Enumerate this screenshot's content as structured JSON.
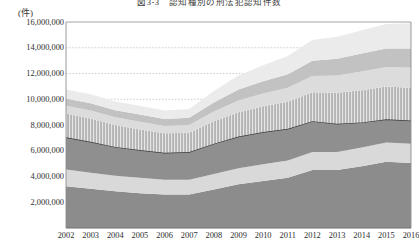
{
  "chart_data": {
    "type": "area",
    "stacked": true,
    "title": "図3-3　認知種別の刑法犯認知件数",
    "unit_label": "(件)",
    "xlabel": "",
    "ylabel": "",
    "categories": [
      2002,
      2003,
      2004,
      2005,
      2006,
      2007,
      2008,
      2009,
      2010,
      2011,
      2012,
      2013,
      2014,
      2015,
      2016
    ],
    "tick_labels_x": [
      "2002",
      "2003",
      "2004",
      "2005",
      "2006",
      "2007",
      "2008",
      "2009",
      "2010",
      "2011",
      "2012",
      "2013",
      "2014",
      "2015",
      "2016"
    ],
    "tick_labels_y": [
      "0",
      "2,000,000",
      "4,000,000",
      "6,000,000",
      "8,000,000",
      "10,000,000",
      "12,000,000",
      "14,000,000",
      "16,000,000"
    ],
    "ylim": [
      0,
      16000000
    ],
    "ytick_step": 2000000,
    "grid": "horizontal-dashed",
    "legend": "none",
    "series": [
      {
        "name": "band-1-bottom",
        "color": "#8c8c8c",
        "values": [
          3250000,
          3050000,
          2850000,
          2700000,
          2600000,
          2600000,
          3000000,
          3400000,
          3650000,
          3900000,
          4500000,
          4500000,
          4800000,
          5150000,
          5050000
        ]
      },
      {
        "name": "band-2",
        "color": "#d9d9d9",
        "values": [
          1300000,
          1250000,
          1200000,
          1200000,
          1150000,
          1150000,
          1200000,
          1250000,
          1300000,
          1350000,
          1400000,
          1400000,
          1450000,
          1500000,
          1500000
        ]
      },
      {
        "name": "band-3-line",
        "color": "#8f8f8f",
        "line_color": "#3d3d3d",
        "values": [
          2500000,
          2400000,
          2250000,
          2150000,
          2100000,
          2150000,
          2350000,
          2450000,
          2500000,
          2450000,
          2400000,
          2200000,
          1950000,
          1800000,
          1800000
        ]
      },
      {
        "name": "band-4-hatched",
        "color": "#b5b5b5",
        "hatched": true,
        "values": [
          1850000,
          1800000,
          1700000,
          1600000,
          1500000,
          1500000,
          1750000,
          1900000,
          2000000,
          2100000,
          2250000,
          2400000,
          2500000,
          2550000,
          2550000
        ]
      },
      {
        "name": "band-5",
        "color": "#dcdcdc",
        "values": [
          600000,
          620000,
          600000,
          600000,
          580000,
          600000,
          750000,
          900000,
          1000000,
          1100000,
          1250000,
          1350000,
          1450000,
          1500000,
          1550000
        ]
      },
      {
        "name": "band-6",
        "color": "#c2c2c2",
        "values": [
          550000,
          560000,
          550000,
          560000,
          540000,
          560000,
          700000,
          850000,
          950000,
          1050000,
          1200000,
          1300000,
          1400000,
          1450000,
          1500000
        ]
      },
      {
        "name": "band-7-top",
        "color": "#ebebeb",
        "values": [
          700000,
          700000,
          680000,
          680000,
          660000,
          680000,
          900000,
          1100000,
          1250000,
          1400000,
          1600000,
          1700000,
          1800000,
          1900000,
          1950000
        ]
      }
    ]
  }
}
